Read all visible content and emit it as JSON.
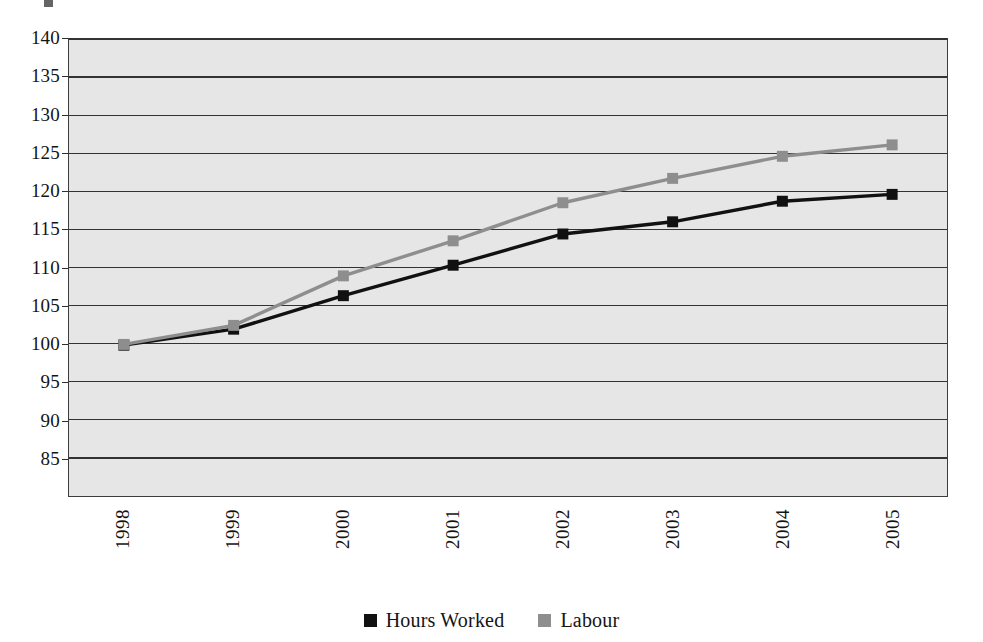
{
  "chart_data": {
    "type": "line",
    "title": "",
    "subtitle": "",
    "xlabel": "",
    "ylabel": "",
    "categories": [
      "1998",
      "1999",
      "2000",
      "2001",
      "2002",
      "2003",
      "2004",
      "2005"
    ],
    "series": [
      {
        "name": "Hours Worked",
        "color": "#111111",
        "marker": "square",
        "values": [
          99.8,
          101.9,
          106.3,
          110.3,
          114.4,
          116.0,
          118.7,
          119.6
        ]
      },
      {
        "name": "Labour",
        "color": "#8e8e8e",
        "marker": "square",
        "values": [
          99.9,
          102.4,
          108.9,
          113.5,
          118.5,
          121.7,
          124.6,
          126.1
        ]
      }
    ],
    "ylim": [
      80,
      140
    ],
    "ytick_values": [
      140,
      135,
      130,
      125,
      120,
      115,
      110,
      105,
      100,
      95,
      90,
      85
    ],
    "ytick_labels": [
      "140",
      "135",
      "130",
      "125",
      "120",
      "115",
      "110",
      "105",
      "100",
      "95",
      "90",
      "85"
    ],
    "grid": true,
    "grid_axis": "y",
    "legend_position": "bottom",
    "plot_background": "#e6e6e6",
    "page_background": "#ffffff",
    "xtick_rotation": 90
  },
  "legend": {
    "entries": [
      {
        "label": "Hours Worked",
        "color": "#111111",
        "swatch_name": "legend-swatch-hours-worked"
      },
      {
        "label": "Labour",
        "color": "#8e8e8e",
        "swatch_name": "legend-swatch-labour"
      }
    ]
  }
}
